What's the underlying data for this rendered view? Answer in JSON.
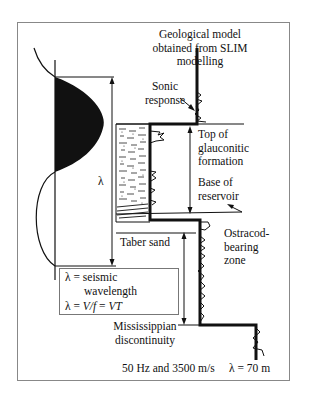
{
  "title": {
    "line1": "Geological model",
    "line2": "obtained from SLIM",
    "line3": "modelling"
  },
  "labels": {
    "sonic_response": [
      "Sonic",
      "response"
    ],
    "top_glauconitic": [
      "Top of",
      "glauconitic",
      "formation"
    ],
    "base_reservoir": [
      "Base of",
      "reservoir"
    ],
    "ostracod": [
      "Ostracod-",
      "bearing",
      "zone"
    ],
    "taber_sand": "Taber sand",
    "mississippian": [
      "Mississippian",
      "discontinuity"
    ],
    "lambda": "λ"
  },
  "formula_box": {
    "line1": "λ = seismic",
    "line2": "wavelength",
    "line3_prefix": "λ = ",
    "line3_v_over_f": "V/f",
    "line3_eq": " = ",
    "line3_vt": "VT"
  },
  "footer": {
    "conditions": "50 Hz and 3500 m/s",
    "result": "λ = 70 m"
  },
  "colors": {
    "ink": "#111111",
    "frame": "#888888",
    "background": "#ffffff"
  }
}
